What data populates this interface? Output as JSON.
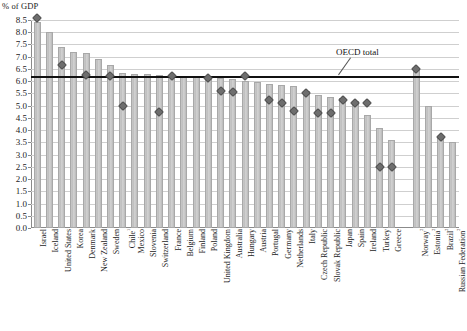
{
  "chart": {
    "unit_label": "% of GDP",
    "annotation": "OECD total"
  },
  "chart_data": {
    "type": "bar",
    "title": "",
    "xlabel": "",
    "ylabel": "% of GDP",
    "ylim": [
      0.0,
      8.5
    ],
    "ytick_labels": [
      "0.0",
      "0.5",
      "1.0",
      "1.5",
      "2.0",
      "2.5",
      "3.0",
      "3.5",
      "4.0",
      "4.5",
      "5.0",
      "5.5",
      "6.0",
      "6.5",
      "7.0",
      "7.5",
      "8.0",
      "8.5"
    ],
    "ytick_values": [
      0.0,
      0.5,
      1.0,
      1.5,
      2.0,
      2.5,
      3.0,
      3.5,
      4.0,
      4.5,
      5.0,
      5.5,
      6.0,
      6.5,
      7.0,
      7.5,
      8.0,
      8.5
    ],
    "grid": true,
    "legend_position": "none",
    "reference_line": {
      "label": "OECD total",
      "value": 6.2
    },
    "categories": [
      "Israel",
      "Iceland",
      "United States",
      "Korea",
      "Denmark",
      "New Zealand",
      "Sweden",
      "Chile¹",
      "Mexico",
      "Slovenia",
      "Switzerland",
      "France",
      "Belgium",
      "Finland",
      "Poland",
      "United Kingdom",
      "Australia",
      "Hungary",
      "Austria",
      "Portugal",
      "Germany",
      "Netherlands",
      "Italy",
      "Czech Republic",
      "Slovak Republic",
      "Japan",
      "Spain",
      "Ireland",
      "Turkey",
      "Greece",
      "",
      "Norway²",
      "Estonia²",
      "Brazil²",
      "Russian Federation²"
    ],
    "series": [
      {
        "name": "bars",
        "type": "bar",
        "values": [
          8.4,
          8.0,
          7.4,
          7.2,
          7.15,
          6.9,
          6.65,
          6.35,
          6.3,
          6.3,
          6.25,
          6.25,
          6.2,
          6.2,
          6.15,
          6.15,
          6.1,
          6.0,
          5.95,
          5.9,
          5.85,
          5.8,
          5.6,
          5.45,
          5.35,
          5.3,
          5.2,
          4.6,
          4.1,
          3.6,
          null,
          6.5,
          5.0,
          3.7,
          3.5
        ]
      },
      {
        "name": "markers",
        "type": "scatter",
        "values": [
          8.6,
          null,
          6.65,
          null,
          6.25,
          null,
          6.2,
          5.0,
          null,
          null,
          4.75,
          6.2,
          null,
          null,
          6.15,
          5.6,
          5.55,
          6.2,
          null,
          5.25,
          5.1,
          4.8,
          5.5,
          4.7,
          4.7,
          5.25,
          5.1,
          5.1,
          2.5,
          2.5,
          null,
          6.5,
          null,
          3.7,
          null
        ]
      }
    ]
  }
}
